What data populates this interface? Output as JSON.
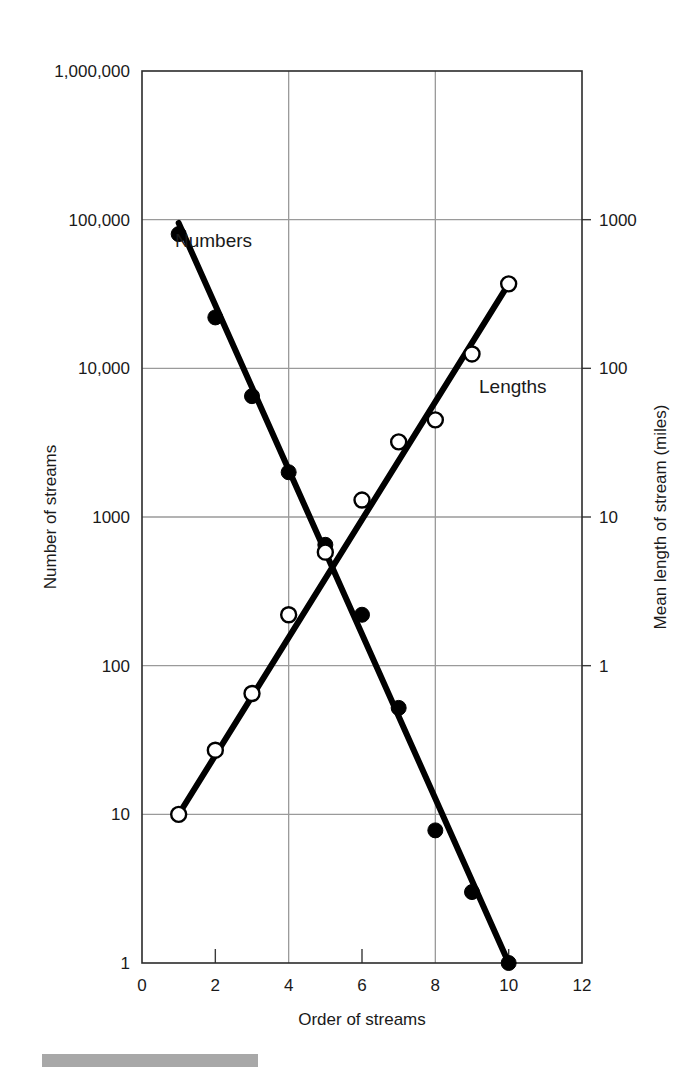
{
  "figure": {
    "left_axis_title": "Number of streams",
    "right_axis_title": "Mean length of stream (miles)",
    "x_axis_title": "Order of streams",
    "left_ticks": [
      "1,000,000",
      "100,000",
      "10,000",
      "1000",
      "100",
      "10",
      "1"
    ],
    "right_ticks": [
      "1000",
      "100",
      "10",
      "1"
    ],
    "x_ticks": [
      "0",
      "2",
      "4",
      "6",
      "8",
      "10",
      "12"
    ],
    "series_labels": {
      "numbers": "Numbers",
      "lengths": "Lengths"
    },
    "colors": {
      "line": "#000000",
      "grid": "#9a9a9a",
      "frame": "#2b2b2b",
      "footer_bar": "#a8a8a8"
    }
  },
  "chart_data": {
    "type": "scatter",
    "title": "",
    "xlabel": "Order of streams",
    "ylabel": "Number of streams",
    "y2label": "Mean length of stream (miles)",
    "xlim": [
      0,
      12
    ],
    "xticks": [
      0,
      2,
      4,
      6,
      8,
      10,
      12
    ],
    "ylim": [
      1,
      1000000
    ],
    "yscale": "log",
    "yticks": [
      1,
      10,
      100,
      1000,
      10000,
      100000,
      1000000
    ],
    "ytick_labels": [
      "1",
      "10",
      "100",
      "1000",
      "10,000",
      "100,000",
      "1,000,000"
    ],
    "y2lim": [
      0.01,
      10000
    ],
    "y2scale": "log",
    "y2ticks": [
      1,
      10,
      100,
      1000
    ],
    "y2tick_labels": [
      "1",
      "10",
      "100",
      "1000"
    ],
    "grid": true,
    "legend": "inline-annotations",
    "series": [
      {
        "name": "Numbers",
        "axis": "left",
        "marker": "filled-circle",
        "x": [
          1,
          2,
          3,
          4,
          5,
          6,
          7,
          8,
          9,
          10
        ],
        "values": [
          80000,
          22000,
          6500,
          2000,
          650,
          220,
          52,
          7.8,
          3.0,
          1.0
        ],
        "trend_x": [
          1,
          10
        ],
        "trend_y": [
          95000,
          1.0
        ]
      },
      {
        "name": "Lengths",
        "axis": "right",
        "marker": "open-circle",
        "x": [
          1,
          2,
          3,
          4,
          5,
          6,
          7,
          8,
          9,
          10
        ],
        "values": [
          0.1,
          0.27,
          0.65,
          2.2,
          5.8,
          13,
          32,
          45,
          125,
          370
        ],
        "trend_x": [
          1,
          10
        ],
        "trend_y": [
          0.1,
          370
        ]
      }
    ]
  }
}
